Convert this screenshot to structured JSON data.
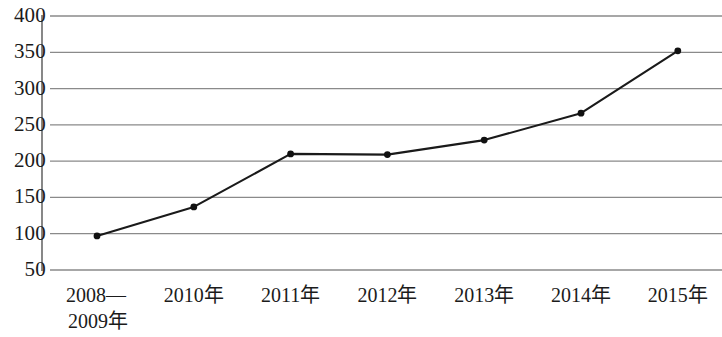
{
  "chart_data": {
    "type": "line",
    "title": "",
    "subtitle": "",
    "xlabel": "",
    "ylabel": "",
    "categories": [
      "2008—2009年",
      "2010年",
      "2011年",
      "2012年",
      "2013年",
      "2014年",
      "2015年"
    ],
    "category_lines": [
      [
        "2008—",
        "2009年"
      ],
      [
        "2010年"
      ],
      [
        "2011年"
      ],
      [
        "2012年"
      ],
      [
        "2013年"
      ],
      [
        "2014年"
      ],
      [
        "2015年"
      ]
    ],
    "values": [
      97,
      137,
      210,
      209,
      229,
      266,
      352
    ],
    "series": [
      {
        "name": "",
        "values": [
          97,
          137,
          210,
          209,
          229,
          266,
          352
        ]
      }
    ],
    "ylim": [
      50,
      400
    ],
    "yticks": [
      400,
      350,
      300,
      250,
      200,
      150,
      100,
      50
    ],
    "ytick_labels": [
      "400",
      "350",
      "300",
      "250",
      "200",
      "150",
      "100",
      "50"
    ],
    "grid": true,
    "grid_axis": "y",
    "legend": false,
    "legend_position": "none",
    "marker": "circle",
    "line_color": "#1a1a1a",
    "marker_color": "#111111",
    "grid_color": "#8a8a8a",
    "axis_color": "#555555",
    "background_color": "#ffffff"
  }
}
